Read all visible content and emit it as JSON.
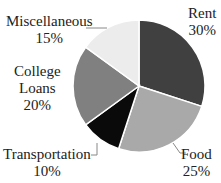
{
  "chart_data": {
    "type": "pie",
    "title": "",
    "categories": [
      "Rent",
      "Food",
      "Transportation",
      "College Loans",
      "Miscellaneous"
    ],
    "values": [
      30,
      25,
      10,
      20,
      15
    ],
    "unit": "%",
    "colors": [
      "#404040",
      "#a9a9a9",
      "#0a0a0a",
      "#808080",
      "#ececec"
    ],
    "start_angle_deg": 0,
    "direction": "clockwise",
    "labels": [
      {
        "name": "Rent",
        "pct": "30%"
      },
      {
        "name": "Food",
        "pct": "25%"
      },
      {
        "name": "Transportation",
        "pct": "10%"
      },
      {
        "name_line1": "College",
        "name_line2": "Loans",
        "pct": "20%"
      },
      {
        "name": "Miscellaneous",
        "pct": "15%"
      }
    ]
  }
}
